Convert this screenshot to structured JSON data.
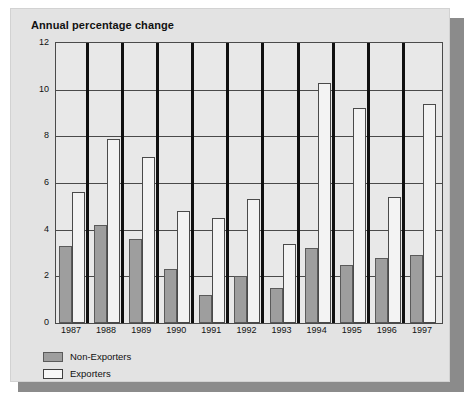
{
  "chart_data": {
    "type": "bar",
    "title": "Annual percentage change",
    "xlabel": "",
    "ylabel": "",
    "ylim": [
      0,
      12
    ],
    "yticks": [
      0,
      2,
      4,
      6,
      8,
      10,
      12
    ],
    "ytick_labels": [
      "0",
      "2",
      "4",
      "6",
      "8",
      "10",
      "12"
    ],
    "grid": true,
    "legend_position": "bottom-left",
    "categories": [
      "1987",
      "1988",
      "1989",
      "1990",
      "1991",
      "1992",
      "1993",
      "1994",
      "1995",
      "1996",
      "1997"
    ],
    "series": [
      {
        "name": "Non-Exporters",
        "color": "#9e9e9e",
        "values": [
          3.3,
          4.2,
          3.6,
          2.3,
          1.2,
          2.0,
          1.5,
          3.2,
          2.5,
          2.8,
          2.9
        ]
      },
      {
        "name": "Exporters",
        "color": "#f3f3f3",
        "values": [
          5.6,
          7.9,
          7.1,
          4.8,
          4.5,
          5.3,
          3.4,
          10.3,
          9.2,
          5.4,
          9.4
        ]
      }
    ]
  },
  "legend": {
    "items": [
      {
        "label": "Non-Exporters",
        "swatch": "nonexp"
      },
      {
        "label": "Exporters",
        "swatch": "exp"
      }
    ]
  },
  "colors": {
    "panel_background": "#e3e3e3",
    "plot_background": "#e8e8e8",
    "axis": "#4a4a4a",
    "divider": "#101010",
    "shadow": "#8b8b8b",
    "non_exporters": "#9e9e9e",
    "exporters": "#f3f3f3"
  }
}
